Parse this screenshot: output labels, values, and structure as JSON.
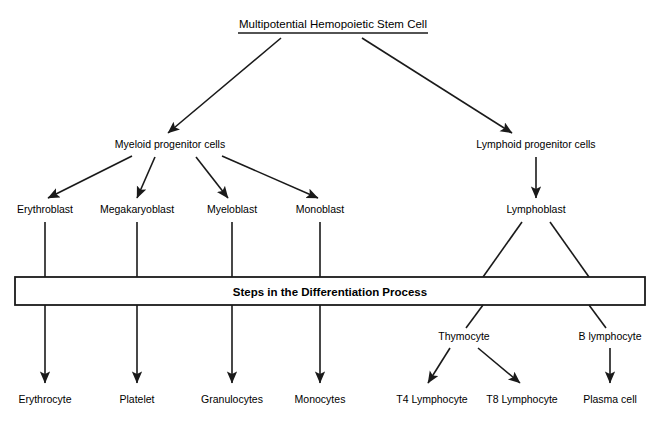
{
  "diagram": {
    "title": "Multipotential Hemopoietic Stem Cell",
    "banner": "Steps in the Differentiation Process",
    "stroke_color": "#1a1a1a",
    "background_color": "#ffffff",
    "nodes": {
      "stem_cell": "Multipotential Hemopoietic Stem Cell",
      "myeloid_progenitor": "Myeloid progenitor cells",
      "lymphoid_progenitor": "Lymphoid progenitor cells",
      "erythroblast": "Erythroblast",
      "megakaryoblast": "Megakaryoblast",
      "myeloblast": "Myeloblast",
      "monoblast": "Monoblast",
      "lymphoblast": "Lymphoblast",
      "thymocyte": "Thymocyte",
      "b_lymphocyte": "B lymphocyte",
      "erythrocyte": "Erythrocyte",
      "platelet": "Platelet",
      "granulocytes": "Granulocytes",
      "monocytes": "Monocytes",
      "t4_lymphocyte": "T4 Lymphocyte",
      "t8_lymphocyte": "T8 Lymphocyte",
      "plasma_cell": "Plasma cell"
    },
    "rows": {
      "title_y": 28,
      "progenitor_y": 148,
      "blast_y": 213,
      "banner_y": 296,
      "intermediate_y": 340,
      "terminal_y": 403
    },
    "banner_box": {
      "x": 15,
      "y": 277,
      "width": 630,
      "height": 28
    },
    "title_underline": {
      "x1": 238,
      "x2": 428,
      "y": 33
    },
    "columns": {
      "erythroblast": 45,
      "megakaryoblast": 137,
      "myeloblast": 232,
      "monoblast": 320,
      "myeloid_progenitor": 170,
      "lymphoid_progenitor": 536,
      "lymphoblast": 536,
      "thymocyte": 464,
      "b_lymphocyte": 610,
      "t4_lymphocyte": 432,
      "t8_lymphocyte": 522
    }
  }
}
